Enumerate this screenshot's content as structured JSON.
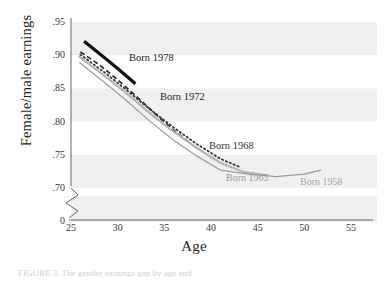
{
  "chart_data": {
    "type": "line",
    "title": "",
    "xlabel": "Age",
    "ylabel": "Female/male earnings",
    "xlim": [
      25,
      55
    ],
    "ylim": [
      0.695,
      0.955
    ],
    "xticks": [
      25,
      30,
      35,
      40,
      45,
      50,
      55
    ],
    "yticks": [
      ".70",
      ".75",
      ".80",
      ".85",
      ".90",
      ".95"
    ],
    "ytick_values": [
      0.7,
      0.75,
      0.8,
      0.85,
      0.9,
      0.95
    ],
    "y_axis_break_label": "0",
    "grid": false,
    "banded_background": true,
    "legend": "inline-labels",
    "series": [
      {
        "name": "Born 1978",
        "label": "Born 1978",
        "style": "solid-thick",
        "color": "#111111",
        "width": 3.2,
        "label_x": 129,
        "label_y": 52,
        "label_size": 10.5,
        "label_color": "#1a1a1a",
        "points": [
          {
            "x": 26.4,
            "y": 0.921
          },
          {
            "x": 28.0,
            "y": 0.903
          },
          {
            "x": 30.0,
            "y": 0.88
          },
          {
            "x": 31.9,
            "y": 0.857
          }
        ]
      },
      {
        "name": "Born 1972",
        "label": "Born 1972",
        "style": "dashed",
        "color": "#2b2b2b",
        "width": 1.7,
        "dash": "5,3",
        "label_x": 160,
        "label_y": 91,
        "label_size": 10.5,
        "label_color": "#1f1f1f",
        "points": [
          {
            "x": 26.0,
            "y": 0.905
          },
          {
            "x": 28.0,
            "y": 0.886
          },
          {
            "x": 30.0,
            "y": 0.863
          },
          {
            "x": 32.0,
            "y": 0.838
          },
          {
            "x": 34.0,
            "y": 0.812
          },
          {
            "x": 36.0,
            "y": 0.787
          },
          {
            "x": 37.9,
            "y": 0.766
          }
        ]
      },
      {
        "name": "Born 1968",
        "label": "Born 1968",
        "style": "dotted",
        "color": "#343434",
        "width": 1.8,
        "dash": "1.4,2.8",
        "label_x": 209,
        "label_y": 140,
        "label_size": 10.5,
        "label_color": "#333333",
        "points": [
          {
            "x": 26.0,
            "y": 0.901
          },
          {
            "x": 28.5,
            "y": 0.875
          },
          {
            "x": 31.0,
            "y": 0.847
          },
          {
            "x": 33.5,
            "y": 0.818
          },
          {
            "x": 36.0,
            "y": 0.791
          },
          {
            "x": 38.5,
            "y": 0.766
          },
          {
            "x": 41.0,
            "y": 0.744
          },
          {
            "x": 43.2,
            "y": 0.731
          }
        ]
      },
      {
        "name": "Born 1963",
        "label": "Born 1963",
        "style": "thin-hatched",
        "color": "#8e8e8e",
        "width": 2.2,
        "label_x": 226,
        "label_y": 172,
        "label_size": 10,
        "label_color": "#9a9a9a",
        "points": [
          {
            "x": 25.9,
            "y": 0.898
          },
          {
            "x": 28.5,
            "y": 0.87
          },
          {
            "x": 31.0,
            "y": 0.842
          },
          {
            "x": 33.5,
            "y": 0.812
          },
          {
            "x": 36.0,
            "y": 0.785
          },
          {
            "x": 38.5,
            "y": 0.76
          },
          {
            "x": 41.0,
            "y": 0.738
          },
          {
            "x": 43.5,
            "y": 0.724
          },
          {
            "x": 46.0,
            "y": 0.719
          }
        ]
      },
      {
        "name": "Born 1958",
        "label": "Born 1958",
        "style": "solid-thin",
        "color": "#9b9b9b",
        "width": 1.2,
        "label_x": 300,
        "label_y": 176,
        "label_size": 10,
        "label_color": "#a6a6a6",
        "points": [
          {
            "x": 25.9,
            "y": 0.889
          },
          {
            "x": 28.5,
            "y": 0.86
          },
          {
            "x": 31.0,
            "y": 0.831
          },
          {
            "x": 33.5,
            "y": 0.8
          },
          {
            "x": 36.0,
            "y": 0.772
          },
          {
            "x": 38.5,
            "y": 0.748
          },
          {
            "x": 41.0,
            "y": 0.727
          },
          {
            "x": 44.0,
            "y": 0.721
          },
          {
            "x": 47.0,
            "y": 0.717
          },
          {
            "x": 50.0,
            "y": 0.721
          },
          {
            "x": 51.8,
            "y": 0.727
          }
        ]
      }
    ]
  },
  "axes": {
    "ylabel": "Female/male earnings",
    "xlabel": "Age",
    "break_label": "0"
  },
  "caption": {
    "text": "FIGURE 3.  The gender earnings gap by age and"
  }
}
